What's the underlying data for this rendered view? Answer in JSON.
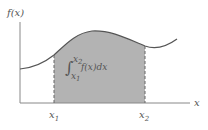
{
  "figure": {
    "y_axis_label": "f(x)",
    "x_axis_label": "x",
    "lower_limit_label": "x",
    "lower_limit_sub": "1",
    "upper_limit_label": "x",
    "upper_limit_sub": "2",
    "integral": {
      "symbol": "∫",
      "upper": "x",
      "upper_sub": "2",
      "lower": "x",
      "lower_sub": "1",
      "integrand": "f(x)dx"
    },
    "colors": {
      "shaded_area": "#b3b3b3",
      "curve": "#555555",
      "axes": "#888888",
      "dashed_lines": "#666666",
      "text": "#555555"
    }
  }
}
